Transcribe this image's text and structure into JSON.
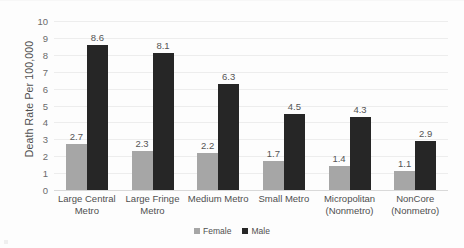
{
  "chart_data": {
    "type": "bar",
    "title": "",
    "xlabel": "",
    "ylabel": "Death Rate Per 100,000",
    "ylim": [
      0,
      10
    ],
    "ytick_step": 1,
    "yticks": [
      "10",
      "9",
      "8",
      "7",
      "6",
      "5",
      "4",
      "3",
      "2",
      "1",
      "0"
    ],
    "grid": true,
    "legend_position": "bottom",
    "categories": [
      "Large Central Metro",
      "Large Fringe Metro",
      "Medium Metro",
      "Small Metro",
      "Micropolitan (Nonmetro)",
      "NonCore (Nonmetro)"
    ],
    "category_lines": [
      [
        "Large Central",
        "Metro"
      ],
      [
        "Large Fringe",
        "Metro"
      ],
      [
        "Medium Metro"
      ],
      [
        "Small Metro"
      ],
      [
        "Micropolitan",
        "(Nonmetro)"
      ],
      [
        "NonCore",
        "(Nonmetro)"
      ]
    ],
    "series": [
      {
        "name": "Female",
        "color": "#A6A6A6",
        "values": [
          2.7,
          2.3,
          2.2,
          1.7,
          1.4,
          1.1
        ],
        "labels": [
          "2.7",
          "2.3",
          "2.2",
          "1.7",
          "1.4",
          "1.1"
        ]
      },
      {
        "name": "Male",
        "color": "#262626",
        "values": [
          8.6,
          8.1,
          6.3,
          4.5,
          4.3,
          2.9
        ],
        "labels": [
          "8.6",
          "8.1",
          "6.3",
          "4.5",
          "4.3",
          "2.9"
        ]
      }
    ]
  },
  "legend": {
    "items": [
      {
        "label": "Female",
        "color": "#A6A6A6"
      },
      {
        "label": "Male",
        "color": "#262626"
      }
    ]
  },
  "colors": {
    "female": "#A6A6A6",
    "male": "#262626",
    "gridline": "#EDEDED",
    "axis": "#D9D9D9",
    "text": "#4F4F4F",
    "background": "#FDFDFD"
  }
}
